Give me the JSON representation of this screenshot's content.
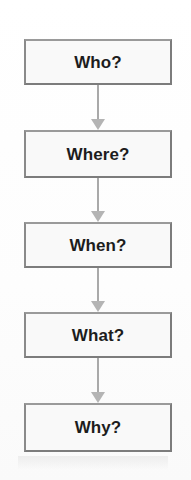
{
  "diagram": {
    "type": "flowchart",
    "orientation": "vertical",
    "title": "",
    "background_color": "#fefefe",
    "node_fill_color": "#f9f9f9",
    "node_border_color": "#7c7c7c",
    "text_color": "#1d1d1d",
    "arrow_color": "#b4b4b4",
    "nodes": [
      {
        "id": "who",
        "label": "Who?",
        "top": 39,
        "height": 46
      },
      {
        "id": "where",
        "label": "Where?",
        "top": 130,
        "height": 48
      },
      {
        "id": "when",
        "label": "When?",
        "top": 222,
        "height": 46
      },
      {
        "id": "what",
        "label": "What?",
        "top": 312,
        "height": 46
      },
      {
        "id": "why",
        "label": "Why?",
        "top": 403,
        "height": 49
      }
    ],
    "connectors": [
      {
        "id": "who-to-where",
        "from": "who",
        "to": "where",
        "top": 85,
        "length": 45
      },
      {
        "id": "where-to-when",
        "from": "where",
        "to": "when",
        "top": 178,
        "length": 44
      },
      {
        "id": "when-to-what",
        "from": "when",
        "to": "what",
        "top": 268,
        "length": 44
      },
      {
        "id": "what-to-why",
        "from": "what",
        "to": "why",
        "top": 358,
        "length": 45
      }
    ]
  }
}
